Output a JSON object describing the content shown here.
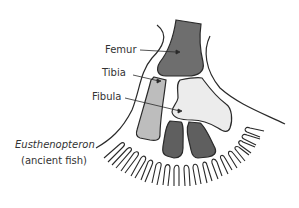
{
  "diagram": {
    "type": "anatomical-illustration",
    "labels": [
      {
        "id": "femur",
        "text": "Femur"
      },
      {
        "id": "tibia",
        "text": "Tibia"
      },
      {
        "id": "fibula",
        "text": "Fibula"
      }
    ],
    "caption": {
      "name": "Eusthenopteron",
      "description": "(ancient fish)"
    },
    "colors": {
      "femur": "#6e6e6e",
      "tibia": "#bdbdbd",
      "fibula": "#ececec",
      "lower_bones": "#5f5f5f",
      "outline": "#2a2a2a",
      "text": "#333333"
    }
  }
}
